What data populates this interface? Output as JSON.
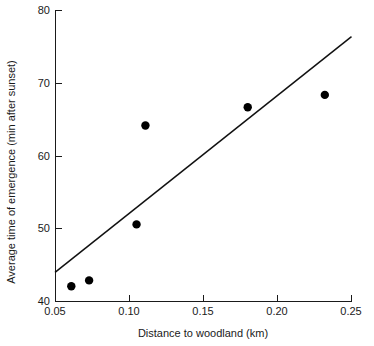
{
  "chart_data": {
    "type": "scatter",
    "title": "",
    "xlabel": "Distance to woodland (km)",
    "ylabel": "Average time of emergence (min after sunset)",
    "xlim": [
      0.05,
      0.25
    ],
    "ylim": [
      40,
      80
    ],
    "grid": false,
    "legend": "none",
    "x_ticks": [
      0.05,
      0.1,
      0.15,
      0.2,
      0.25
    ],
    "x_tick_labels": [
      "0.05",
      "0.10",
      "0.15",
      "0.20",
      "0.25"
    ],
    "y_ticks": [
      40,
      50,
      60,
      70,
      80
    ],
    "y_tick_labels": [
      "40",
      "50",
      "60",
      "70",
      "80"
    ],
    "points": [
      {
        "x": 0.061,
        "y": 42.1
      },
      {
        "x": 0.073,
        "y": 42.9
      },
      {
        "x": 0.105,
        "y": 50.6
      },
      {
        "x": 0.111,
        "y": 64.2
      },
      {
        "x": 0.18,
        "y": 66.7
      },
      {
        "x": 0.232,
        "y": 68.4
      }
    ],
    "series": [
      {
        "name": "Observations",
        "marker": "filled-circle",
        "color": "#000000",
        "x": [
          0.061,
          0.073,
          0.105,
          0.111,
          0.18,
          0.232
        ],
        "values": [
          42.1,
          42.9,
          50.6,
          64.2,
          66.7,
          68.4
        ]
      },
      {
        "name": "Fitted regression line",
        "type": "line",
        "color": "#111111",
        "x": [
          0.05,
          0.25
        ],
        "values": [
          44.0,
          76.4
        ]
      }
    ],
    "annotations": []
  },
  "axes": {
    "x_axis_label": "Distance to woodland (km)",
    "y_axis_label": "Average time of emergence (min after sunset)"
  }
}
